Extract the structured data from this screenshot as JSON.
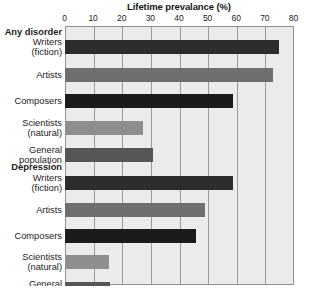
{
  "chart_data": {
    "type": "bar",
    "orientation": "horizontal",
    "title": "Lifetime prevalance (%)",
    "xlabel": "Lifetime prevalance (%)",
    "ylabel": "",
    "xlim": [
      0,
      80
    ],
    "xticks": [
      0,
      10,
      20,
      30,
      40,
      50,
      60,
      70,
      80
    ],
    "xtick_labels": [
      "0",
      "10",
      "20",
      "30",
      "40",
      "50",
      "60",
      "70",
      "80"
    ],
    "grid": true,
    "legend": "none",
    "groups": [
      {
        "name": "Any disorder",
        "categories": [
          "Writers (fiction)",
          "Artists",
          "Composers",
          "Scientists (natural)",
          "General population"
        ],
        "values": [
          75,
          73,
          59,
          27.5,
          31
        ]
      },
      {
        "name": "Depression",
        "categories": [
          "Writers (fiction)",
          "Artists",
          "Composers",
          "Scientists (natural)",
          "General population"
        ],
        "values": [
          59,
          49,
          46,
          15.5,
          16
        ]
      }
    ],
    "bar_colors": [
      "#2c2c2c",
      "#6f6f6f",
      "#1b1b1b",
      "#8e8e8e",
      "#565656"
    ],
    "plot_background": "#ebebeb",
    "gridline_color": "#9a9a9a",
    "axis_color": "#909090"
  },
  "rows": [
    {
      "kind": "header",
      "label": "Any disorder",
      "top": 1,
      "value": null,
      "color": null
    },
    {
      "kind": "bar",
      "label": "Writers\n(fiction)",
      "top": 14,
      "value": 75,
      "color": "#2c2c2c"
    },
    {
      "kind": "bar",
      "label": "Artists",
      "top": 42,
      "value": 73,
      "color": "#6f6f6f"
    },
    {
      "kind": "bar",
      "label": "Composers",
      "top": 68,
      "value": 59,
      "color": "#1b1b1b"
    },
    {
      "kind": "bar",
      "label": "Scientists\n(natural)",
      "top": 95,
      "value": 27.5,
      "color": "#8e8e8e"
    },
    {
      "kind": "bar",
      "label": "General\npopulation",
      "top": 122,
      "value": 31,
      "color": "#565656"
    },
    {
      "kind": "header",
      "label": "Depression",
      "top": 136,
      "value": null,
      "color": null
    },
    {
      "kind": "bar",
      "label": "Writers\n(fiction)",
      "top": 150,
      "value": 59,
      "color": "#2c2c2c"
    },
    {
      "kind": "bar",
      "label": "Artists",
      "top": 177,
      "value": 49,
      "color": "#6f6f6f"
    },
    {
      "kind": "bar",
      "label": "Composers",
      "top": 203,
      "value": 46,
      "color": "#1b1b1b"
    },
    {
      "kind": "bar",
      "label": "Scientists\n(natural)",
      "top": 229,
      "value": 15.5,
      "color": "#8e8e8e"
    },
    {
      "kind": "bar",
      "label": "General\npopulation",
      "top": 256,
      "value": 16,
      "color": "#565656"
    }
  ],
  "geometry": {
    "plot_left": 64.5,
    "plot_width": 229,
    "x_max": 80,
    "bar_height": 14,
    "label_line_height": 10.5
  }
}
